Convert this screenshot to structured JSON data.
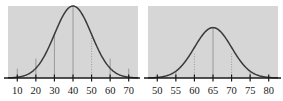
{
  "figure": {
    "panel_color": "#d6d6d6",
    "curve_color": "#3a3a3a",
    "axis_color": "#1a1a1a",
    "gridline_color": "#8a8a8a",
    "background_color": "#ffffff"
  },
  "chart_data": [
    {
      "type": "line",
      "name": "left-normal-curve",
      "title": "",
      "xlabel": "",
      "ylabel": "",
      "xlim": [
        5,
        75
      ],
      "ylim": [
        0,
        1
      ],
      "grid": true,
      "legend": "none",
      "categories": [
        10,
        20,
        30,
        40,
        50,
        60,
        70
      ],
      "tick_labels": [
        "10",
        "20",
        "30",
        "40",
        "50",
        "60",
        "70"
      ],
      "distribution": {
        "mean": 40,
        "std": 10,
        "peak_x": 40,
        "peak_height": 1.0
      },
      "gridlines": [
        {
          "x": 10,
          "style": "solid",
          "height": 0.13
        },
        {
          "x": 20,
          "style": "solid",
          "height": 0.27
        },
        {
          "x": 30,
          "style": "solid",
          "height": 0.62
        },
        {
          "x": 40,
          "style": "solid",
          "height": 1.0
        },
        {
          "x": 50,
          "style": "dotted",
          "height": 0.62
        },
        {
          "x": 60,
          "style": "solid",
          "height": 0.27
        },
        {
          "x": 70,
          "style": "solid",
          "height": 0.13
        }
      ],
      "x": [
        5,
        10,
        15,
        20,
        25,
        30,
        35,
        40,
        45,
        50,
        55,
        60,
        65,
        70,
        75
      ],
      "values": [
        0.04,
        0.13,
        0.32,
        0.61,
        0.88,
        1.0,
        0.88,
        0.61,
        0.32,
        0.13,
        0.04,
        0.01,
        0.0,
        0.0,
        0.0
      ]
    },
    {
      "type": "line",
      "name": "right-normal-curve",
      "title": "",
      "xlabel": "",
      "ylabel": "",
      "xlim": [
        47.5,
        82.5
      ],
      "ylim": [
        0,
        1
      ],
      "grid": true,
      "legend": "none",
      "categories": [
        50,
        55,
        60,
        65,
        70,
        75,
        80
      ],
      "tick_labels": [
        "50",
        "55",
        "60",
        "65",
        "70",
        "75",
        "80"
      ],
      "distribution": {
        "mean": 65,
        "std": 5,
        "peak_x": 65,
        "peak_height": 0.7
      },
      "gridlines": [
        {
          "x": 55,
          "style": "solid",
          "height": 0.1
        },
        {
          "x": 60,
          "style": "dotted",
          "height": 0.36
        },
        {
          "x": 65,
          "style": "solid",
          "height": 0.7
        },
        {
          "x": 70,
          "style": "dotted",
          "height": 0.36
        },
        {
          "x": 75,
          "style": "solid",
          "height": 0.1
        }
      ],
      "x": [
        47.5,
        50,
        52.5,
        55,
        57.5,
        60,
        62.5,
        65,
        67.5,
        70,
        72.5,
        75,
        77.5,
        80,
        82.5
      ],
      "values": [
        0.01,
        0.02,
        0.05,
        0.1,
        0.21,
        0.36,
        0.56,
        0.7,
        0.56,
        0.36,
        0.21,
        0.1,
        0.05,
        0.02,
        0.01
      ]
    }
  ]
}
